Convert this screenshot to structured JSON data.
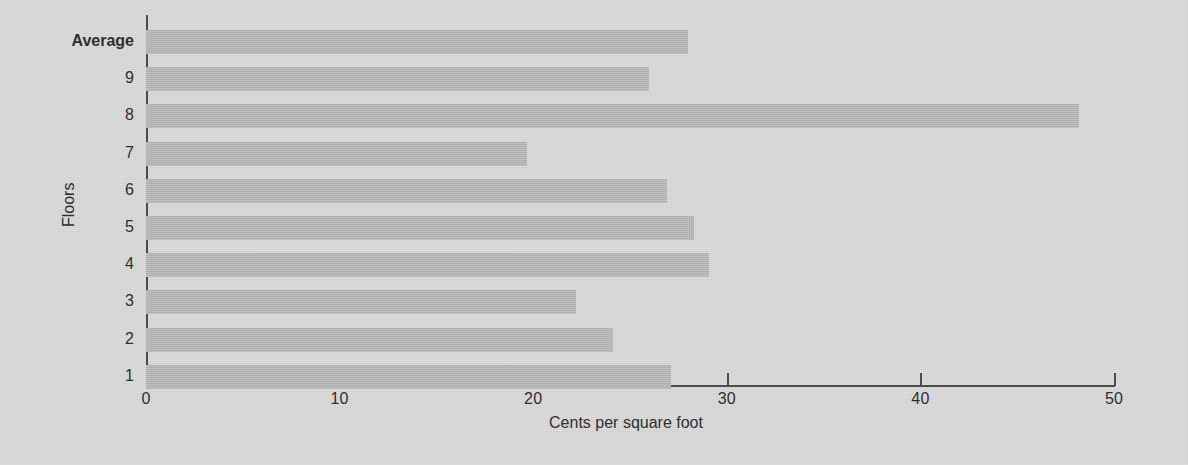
{
  "chart_data": {
    "type": "bar",
    "orientation": "horizontal",
    "title": "",
    "subtitle": "",
    "xlabel": "Cents per square foot",
    "ylabel": "Floors",
    "xlim": [
      0,
      50
    ],
    "xticks": [
      0,
      10,
      20,
      30,
      40,
      50
    ],
    "xtick_labels": [
      "0",
      "10",
      "20",
      "30",
      "40",
      "50"
    ],
    "grid": false,
    "legend": null,
    "categories": [
      "Average",
      "9",
      "8",
      "7",
      "6",
      "5",
      "4",
      "3",
      "2",
      "1"
    ],
    "values": [
      28.0,
      26.0,
      48.2,
      19.7,
      26.9,
      28.3,
      29.1,
      22.2,
      24.1,
      27.1
    ],
    "highlight_category": "Average",
    "colors": {
      "background": "#d7d7d6",
      "bar": "#b4b4b4",
      "axis": "#4c4c4c",
      "text": "#2e2e2e"
    },
    "bars": [
      {
        "label": "Average",
        "value": 28.0,
        "bold": true
      },
      {
        "label": "9",
        "value": 26.0,
        "bold": false
      },
      {
        "label": "8",
        "value": 48.2,
        "bold": false
      },
      {
        "label": "7",
        "value": 19.7,
        "bold": false
      },
      {
        "label": "6",
        "value": 26.9,
        "bold": false
      },
      {
        "label": "5",
        "value": 28.3,
        "bold": false
      },
      {
        "label": "4",
        "value": 29.1,
        "bold": false
      },
      {
        "label": "3",
        "value": 22.2,
        "bold": false
      },
      {
        "label": "2",
        "value": 24.1,
        "bold": false
      },
      {
        "label": "1",
        "value": 27.1,
        "bold": false
      }
    ]
  }
}
